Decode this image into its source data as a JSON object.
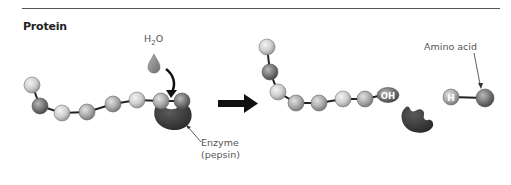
{
  "title": "Protein",
  "water_label": {
    "base": "H",
    "subscript": "2",
    "suffix": "O"
  },
  "enzyme_label": {
    "line1": "Enzyme",
    "line2": "(pepsin)"
  },
  "amino_acid_label": "Amino acid",
  "oh_label": "OH",
  "h_label": "H",
  "colors": {
    "rule_line": "#555555",
    "bead_light": "#d4d4d4",
    "bead_medium": "#b0b0b0",
    "bead_dark": "#7a7a7a",
    "enzyme": "#3a3a3a",
    "arrow": "#111111",
    "water_drop": "#8a8a8a"
  },
  "left_chain": {
    "beads": [
      {
        "x": 32,
        "y": 85,
        "shade": "light"
      },
      {
        "x": 40,
        "y": 106,
        "shade": "dark"
      },
      {
        "x": 62,
        "y": 113,
        "shade": "light"
      },
      {
        "x": 87,
        "y": 112,
        "shade": "medium"
      },
      {
        "x": 113,
        "y": 104,
        "shade": "medium"
      },
      {
        "x": 137,
        "y": 100,
        "shade": "light"
      },
      {
        "x": 161,
        "y": 101,
        "shade": "medium"
      },
      {
        "x": 182,
        "y": 101,
        "shade": "dark"
      }
    ]
  },
  "right_chain": {
    "beads": [
      {
        "x": 267,
        "y": 47,
        "shade": "light"
      },
      {
        "x": 270,
        "y": 72,
        "shade": "dark"
      },
      {
        "x": 278,
        "y": 92,
        "shade": "light"
      },
      {
        "x": 296,
        "y": 103,
        "shade": "medium"
      },
      {
        "x": 319,
        "y": 103,
        "shade": "medium"
      },
      {
        "x": 343,
        "y": 99,
        "shade": "light"
      },
      {
        "x": 365,
        "y": 99,
        "shade": "medium"
      }
    ],
    "oh_group": {
      "x": 387,
      "y": 94
    }
  },
  "amino_acid": {
    "h_bead": {
      "x": 451,
      "y": 97
    },
    "bead": {
      "x": 485,
      "y": 98,
      "shade": "dark"
    }
  },
  "steps": [
    {
      "stage": "before",
      "description": "Protein chain bound to enzyme (pepsin) with water added"
    },
    {
      "stage": "after",
      "description": "Shortened chain ending in OH, free enzyme, and released amino acid (H-bonded)"
    }
  ]
}
